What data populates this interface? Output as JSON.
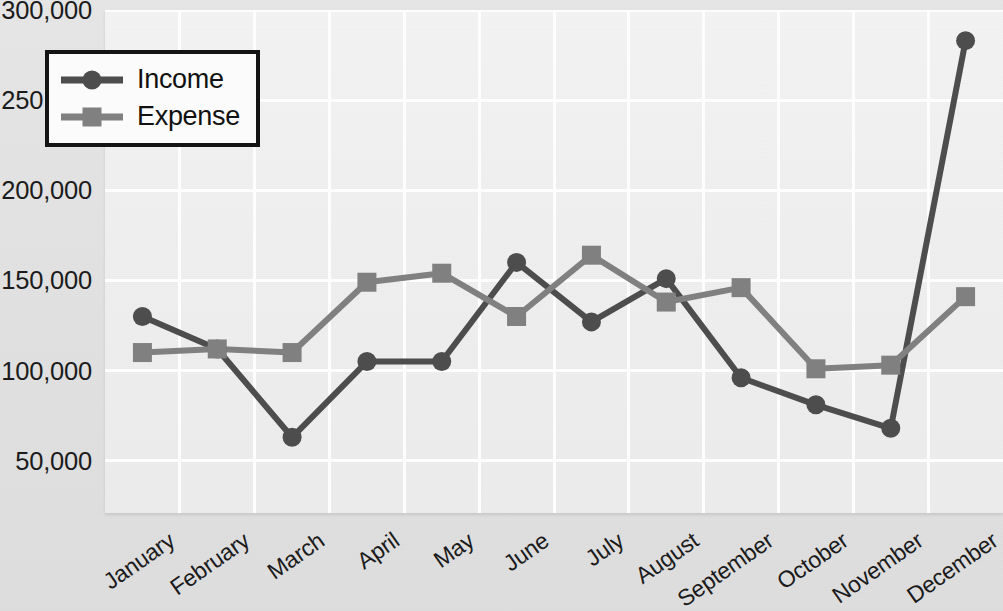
{
  "chart_data": {
    "type": "line",
    "title": "",
    "xlabel": "",
    "ylabel": "",
    "categories": [
      "January",
      "February",
      "March",
      "April",
      "May",
      "June",
      "July",
      "August",
      "September",
      "October",
      "November",
      "December"
    ],
    "series": [
      {
        "name": "Income",
        "marker": "circle",
        "color": "#4d4d4d",
        "values": [
          130000,
          112000,
          63000,
          105000,
          105000,
          160000,
          127000,
          151000,
          96000,
          81000,
          68000,
          283000
        ]
      },
      {
        "name": "Expense",
        "marker": "square",
        "color": "#808080",
        "values": [
          110000,
          112000,
          110000,
          149000,
          154000,
          130000,
          164000,
          138000,
          146000,
          101000,
          103000,
          141000
        ]
      }
    ],
    "ylim": [
      21000,
      300000
    ],
    "yticks": [
      300000,
      250000,
      200000,
      150000,
      100000,
      50000
    ],
    "ytick_labels": [
      "300,000",
      "250,000",
      "200,000",
      "150,000",
      "100,000",
      "50,000"
    ],
    "grid": true,
    "legend_position": "top-left"
  },
  "legend": {
    "entries": [
      {
        "label": "Income",
        "marker_icon": "circle-marker-icon"
      },
      {
        "label": "Expense",
        "marker_icon": "square-marker-icon"
      }
    ]
  },
  "colors": {
    "income": "#4d4d4d",
    "expense": "#808080",
    "plot_background": "#efefef",
    "canvas_background": "#e2e2e2",
    "gridline": "#fdfdfd",
    "legend_border": "#141414",
    "text": "#1b1b1b"
  }
}
